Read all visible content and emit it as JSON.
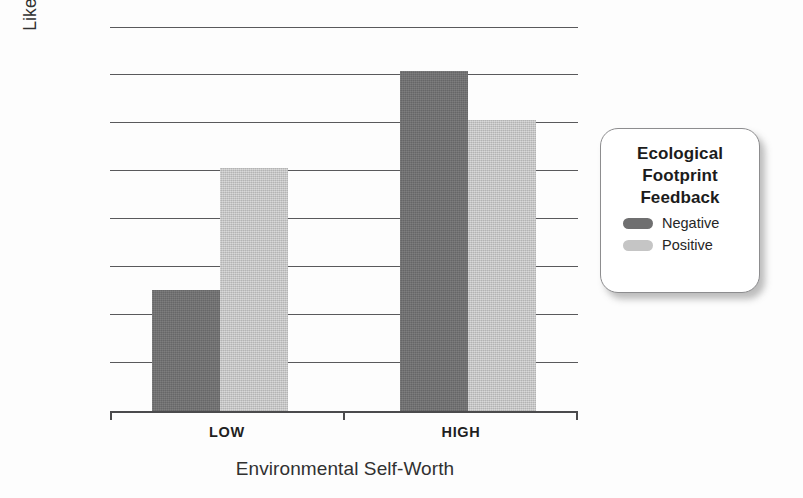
{
  "chart_data": {
    "type": "bar",
    "title": "",
    "xlabel": "Environmental Self-Worth",
    "ylabel": "Likelihood of Writing Environmental Policy Letter",
    "ylabel_lines": [
      "Likelihood of Writing Environmental",
      "Policy Letter"
    ],
    "categories": [
      "LOW",
      "HIGH"
    ],
    "series": [
      {
        "name": "Negative",
        "color": "#6f6f70",
        "values": [
          2.5,
          7.0
        ]
      },
      {
        "name": "Positive",
        "color": "#c5c5c5",
        "values": [
          5.0,
          6.0
        ]
      }
    ],
    "ylim": [
      0,
      8
    ],
    "y_tick_count": 8,
    "y_tick_labels": [],
    "grid": true,
    "legend_position": "right",
    "legend_title_lines": [
      "Ecological",
      "Footprint",
      "Feedback"
    ]
  },
  "axes": {
    "y_title_line1": "Likelihood of Writing Environmental",
    "y_title_line2": "Policy Letter",
    "x_title": "Environmental Self-Worth",
    "x_tick_low": "LOW",
    "x_tick_high": "HIGH"
  },
  "legend": {
    "title_line1": "Ecological",
    "title_line2": "Footprint",
    "title_line3": "Feedback",
    "items": [
      {
        "label": "Negative",
        "color": "#6f6f70"
      },
      {
        "label": "Positive",
        "color": "#c5c5c5"
      }
    ]
  },
  "colors": {
    "negative": "#6f6f70",
    "positive": "#c5c5c5",
    "gridline": "#59595c",
    "axis": "#4b4b4d",
    "text": "#2b2b2b",
    "background": "#fdfdfd"
  },
  "bars": [
    {
      "group": "LOW",
      "series": "Negative",
      "value": 2.5
    },
    {
      "group": "LOW",
      "series": "Positive",
      "value": 5.0
    },
    {
      "group": "HIGH",
      "series": "Negative",
      "value": 7.0
    },
    {
      "group": "HIGH",
      "series": "Positive",
      "value": 6.0
    }
  ]
}
